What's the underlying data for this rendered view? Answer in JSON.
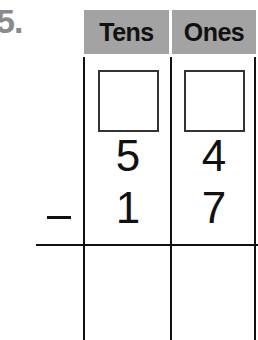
{
  "problem": {
    "number_label": "5.",
    "operation": "subtraction",
    "operator_symbol": "−"
  },
  "table": {
    "headers": [
      "Tens",
      "Ones"
    ],
    "header_color": "#a3a3a3",
    "regroup_boxes": [
      "",
      ""
    ],
    "minuend": {
      "tens": "5",
      "ones": "4"
    },
    "subtrahend": {
      "tens": "1",
      "ones": "7"
    },
    "answer": {
      "tens": "",
      "ones": ""
    }
  }
}
